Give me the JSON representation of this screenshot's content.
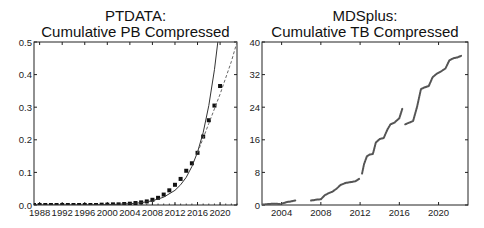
{
  "chart_data": [
    {
      "type": "line",
      "title": "PTDATA:",
      "subtitle": "Cumulative PB Compressed",
      "xlabel": "",
      "ylabel": "",
      "xlim": [
        1987,
        2023
      ],
      "ylim": [
        0,
        0.5
      ],
      "x_ticks": [
        1988,
        1992,
        1996,
        2000,
        2004,
        2008,
        2012,
        2016,
        2020
      ],
      "y_ticks": [
        0.0,
        0.1,
        0.2,
        0.3,
        0.4,
        0.5
      ],
      "y_tick_labels": [
        "0.0",
        "0.1",
        "0.2",
        "0.3",
        "0.4",
        "0.5"
      ],
      "grid": false,
      "series": [
        {
          "name": "Observed (markers)",
          "style": "square-markers",
          "x": [
            1987,
            1988,
            1989,
            1990,
            1991,
            1992,
            1993,
            1994,
            1995,
            1996,
            1997,
            1998,
            1999,
            2000,
            2001,
            2002,
            2003,
            2004,
            2005,
            2006,
            2007,
            2008,
            2009,
            2010,
            2011,
            2012,
            2013,
            2014,
            2015,
            2016,
            2017,
            2018,
            2019,
            2020
          ],
          "y": [
            0.0,
            0.0,
            0.0,
            0.0,
            0.0,
            0.0,
            0.0,
            0.0,
            0.0,
            0.0,
            0.0,
            0.0,
            0.001,
            0.001,
            0.002,
            0.002,
            0.003,
            0.004,
            0.006,
            0.008,
            0.011,
            0.016,
            0.022,
            0.032,
            0.045,
            0.062,
            0.08,
            0.105,
            0.128,
            0.16,
            0.21,
            0.26,
            0.305,
            0.365
          ]
        },
        {
          "name": "Fit (solid)",
          "style": "solid-line",
          "x": [
            1987,
            1995,
            2000,
            2004,
            2006,
            2008,
            2010,
            2012,
            2013,
            2014,
            2015,
            2016,
            2017,
            2018,
            2019,
            2019.6
          ],
          "y": [
            0.0,
            0.0,
            0.001,
            0.004,
            0.007,
            0.013,
            0.024,
            0.045,
            0.062,
            0.085,
            0.118,
            0.162,
            0.222,
            0.305,
            0.415,
            0.5
          ]
        },
        {
          "name": "Projection (dashed)",
          "style": "dashed-line",
          "x": [
            2016,
            2017,
            2018,
            2019,
            2020,
            2021,
            2022,
            2023
          ],
          "y": [
            0.16,
            0.205,
            0.25,
            0.295,
            0.34,
            0.39,
            0.44,
            0.5
          ]
        }
      ]
    },
    {
      "type": "line",
      "title": "MDSplus:",
      "subtitle": "Cumulative TB Compressed",
      "xlabel": "",
      "ylabel": "",
      "xlim": [
        2002,
        2023
      ],
      "ylim": [
        0,
        40
      ],
      "x_ticks": [
        2004,
        2008,
        2012,
        2016,
        2020
      ],
      "y_ticks": [
        0,
        8,
        16,
        24,
        32,
        40
      ],
      "y_tick_labels": [
        "0",
        "8",
        "16",
        "24",
        "32",
        "40"
      ],
      "grid": false,
      "series": [
        {
          "name": "Segment 1",
          "style": "dense-dots",
          "x": [
            2002.0,
            2002.5,
            2003.0,
            2003.5,
            2003.9
          ],
          "y": [
            0.1,
            0.2,
            0.3,
            0.3,
            0.2
          ]
        },
        {
          "name": "Segment 2",
          "style": "dense-dots",
          "x": [
            2004.1,
            2004.5,
            2005.0,
            2005.4
          ],
          "y": [
            0.4,
            0.7,
            0.9,
            1.1
          ]
        },
        {
          "name": "Segment 3",
          "style": "dense-dots",
          "x": [
            2007.0,
            2007.5,
            2008.0,
            2008.4,
            2008.8,
            2009.2,
            2009.6,
            2010.0,
            2010.5,
            2011.0,
            2011.5,
            2011.9
          ],
          "y": [
            1.1,
            1.3,
            1.4,
            2.4,
            2.9,
            3.3,
            4.0,
            4.9,
            5.4,
            5.6,
            5.8,
            6.4
          ]
        },
        {
          "name": "Segment 4",
          "style": "dense-dots",
          "x": [
            2012.2,
            2012.4,
            2012.7,
            2013.0,
            2013.3,
            2013.6,
            2014.0,
            2014.4,
            2014.8,
            2015.1,
            2015.5,
            2016.0,
            2016.3
          ],
          "y": [
            7.7,
            10.0,
            12.0,
            12.4,
            12.5,
            15.3,
            16.2,
            16.4,
            18.6,
            19.8,
            20.2,
            21.3,
            23.6
          ]
        },
        {
          "name": "Segment 5",
          "style": "dense-dots",
          "x": [
            2016.6,
            2017.0,
            2017.4,
            2017.8,
            2018.2,
            2018.5,
            2019.0,
            2019.4,
            2019.8,
            2020.2,
            2020.7,
            2021.1,
            2021.5,
            2021.9,
            2022.3
          ],
          "y": [
            19.8,
            20.2,
            20.6,
            24.0,
            28.4,
            28.8,
            29.2,
            31.4,
            32.2,
            32.7,
            33.5,
            35.5,
            36.0,
            36.2,
            36.6
          ]
        }
      ]
    }
  ]
}
